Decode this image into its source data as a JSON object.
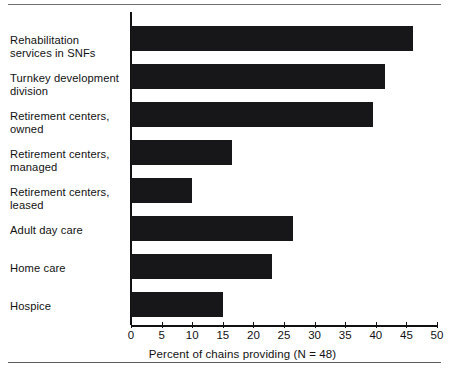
{
  "chart_data": {
    "type": "bar",
    "orientation": "horizontal",
    "title": "",
    "xlabel": "Percent of chains providing (N = 48)",
    "ylabel": "",
    "xlim": [
      0,
      50
    ],
    "xticks": [
      0,
      5,
      10,
      15,
      20,
      25,
      30,
      35,
      40,
      45,
      50
    ],
    "xtick_labels": [
      "0",
      "5",
      "10",
      "15",
      "20",
      "25",
      "30",
      "35",
      "40",
      "45",
      "50"
    ],
    "grid": false,
    "legend": null,
    "bar_color": "#17171a",
    "categories": [
      "Rehabilitation\nservices in SNFs",
      "Turnkey development\ndivision",
      "Retirement centers,\nowned",
      "Retirement centers,\nmanaged",
      "Retirement centers,\nleased",
      "Adult day care",
      "Home care",
      "Hospice"
    ],
    "values": [
      46,
      41.5,
      39.5,
      16.5,
      10,
      26.5,
      23,
      15
    ]
  },
  "axis": {
    "x_caption": "Percent of chains providing (N = 48)"
  }
}
